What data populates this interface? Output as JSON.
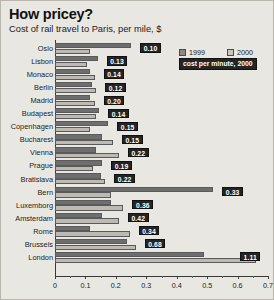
{
  "header": {
    "title": "How pricey?",
    "subtitle": "Cost of rail travel to Paris, per mile, $"
  },
  "legend": {
    "items": [
      {
        "label": "1999",
        "color": "#8d8a84"
      },
      {
        "label": "2000",
        "color": "#c9c6c0"
      }
    ],
    "note": "cost per minute, 2000"
  },
  "axis": {
    "ticks": [
      "0",
      "0.1",
      "0.2",
      "0.3",
      "0.4",
      "0.5",
      "0.6",
      "0.7"
    ]
  },
  "chart_data": {
    "type": "bar",
    "orientation": "horizontal",
    "title": "How pricey?",
    "subtitle": "Cost of rail travel to Paris, per mile, $",
    "xlabel": "",
    "ylabel": "",
    "xlim": [
      0,
      0.7
    ],
    "grid": false,
    "legend_position": "top-right",
    "categories": [
      "Oslo",
      "Lisbon",
      "Monaco",
      "Berlin",
      "Madrid",
      "Budapest",
      "Copenhagen",
      "Bucharest",
      "Vienna",
      "Prague",
      "Bratislava",
      "Bern",
      "Luxemborg",
      "Amsterdam",
      "Rome",
      "Brussels",
      "London"
    ],
    "series": [
      {
        "name": "1999",
        "color": "#6e6e6e",
        "values": [
          0.25,
          0.14,
          0.115,
          0.12,
          0.115,
          0.145,
          0.175,
          0.155,
          0.135,
          0.155,
          0.15,
          0.52,
          0.185,
          0.155,
          0.115,
          0.235,
          0.49
        ]
      },
      {
        "name": "2000",
        "color": "#bdbab4",
        "values": [
          0.115,
          0.105,
          0.13,
          0.135,
          0.13,
          0.135,
          0.115,
          0.19,
          0.21,
          0.125,
          0.165,
          0.185,
          0.225,
          0.21,
          0.245,
          0.265,
          0.66
        ]
      }
    ],
    "point_labels": {
      "name": "cost per minute, 2000",
      "values": [
        "0.10",
        "0.13",
        "0.14",
        "0.12",
        "0.20",
        "0.14",
        "0.15",
        "0.15",
        "0.22",
        "0.19",
        "0.22",
        "0.33",
        "0.36",
        "0.42",
        "0.34",
        "0.68",
        "1.11"
      ]
    }
  }
}
